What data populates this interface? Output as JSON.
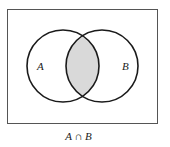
{
  "diagram": {
    "type": "venn",
    "sets": [
      {
        "label": "A",
        "cx": 63,
        "cy": 66,
        "r": 36
      },
      {
        "label": "B",
        "cx": 102,
        "cy": 66,
        "r": 36
      }
    ],
    "highlighted_region": "intersection",
    "shade_color": "#d9d9d9",
    "caption": "A ∩ B"
  }
}
